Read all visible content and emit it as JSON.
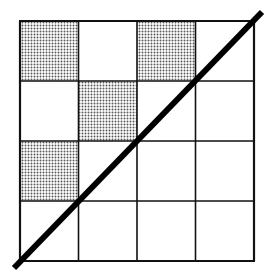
{
  "diagram": {
    "type": "grid-with-diagonal",
    "rows": 4,
    "cols": 4,
    "grid_bounds": {
      "x0": 20,
      "y0": 21,
      "x1": 254,
      "y1": 261
    },
    "shaded_cells": [
      {
        "row": 0,
        "col": 0
      },
      {
        "row": 0,
        "col": 2
      },
      {
        "row": 1,
        "col": 1
      },
      {
        "row": 2,
        "col": 0
      }
    ],
    "diagonal": {
      "x1": 14,
      "y1": 268,
      "x2": 262,
      "y2": 12,
      "width": 6
    },
    "colors": {
      "background": "#ffffff",
      "grid_line": "#111111",
      "shade_dot": "#555555",
      "diagonal": "#000000"
    }
  }
}
